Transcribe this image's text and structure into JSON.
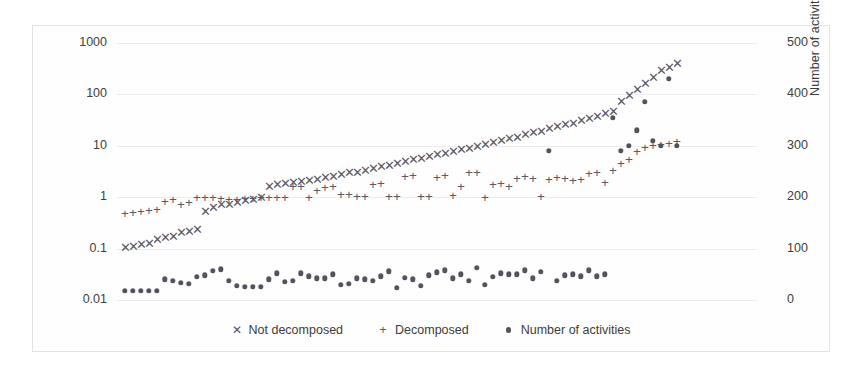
{
  "chart_data": {
    "type": "scatter",
    "title": "",
    "subtitle": "",
    "xlabel": "",
    "ylabel": "Computation time (in seconds)",
    "y2label": "Number of activities",
    "yscale": "log",
    "ylim": [
      0.01,
      1000
    ],
    "y2lim": [
      0,
      500
    ],
    "xlim": [
      0,
      80
    ],
    "grid": true,
    "legend_position": "bottom-center",
    "yticks": [
      "0.01",
      "0.1",
      "1",
      "10",
      "100",
      "1000"
    ],
    "ytick_values": [
      0.01,
      0.1,
      1,
      10,
      100,
      1000
    ],
    "y2ticks": [
      "0",
      "100",
      "200",
      "300",
      "400",
      "500"
    ],
    "y2tick_values": [
      0,
      100,
      200,
      300,
      400,
      500
    ],
    "xtick_labels": [],
    "series": [
      {
        "name": "Not decomposed",
        "marker": "cross",
        "glyph": "✕",
        "color": "#5a5a64",
        "axis": "left",
        "x": [
          1,
          2,
          3,
          4,
          5,
          6,
          7,
          8,
          9,
          10,
          11,
          12,
          13,
          14,
          15,
          16,
          17,
          18,
          19,
          20,
          21,
          22,
          23,
          24,
          25,
          26,
          27,
          28,
          29,
          30,
          31,
          32,
          33,
          34,
          35,
          36,
          37,
          38,
          39,
          40,
          41,
          42,
          43,
          44,
          45,
          46,
          47,
          48,
          49,
          50,
          51,
          52,
          53,
          54,
          55,
          56,
          57,
          58,
          59,
          60,
          61,
          62,
          63,
          64,
          65,
          66,
          67,
          68,
          69,
          70
        ],
        "y": [
          0.105,
          0.11,
          0.12,
          0.125,
          0.15,
          0.16,
          0.17,
          0.2,
          0.21,
          0.23,
          0.52,
          0.62,
          0.7,
          0.72,
          0.78,
          0.83,
          0.88,
          0.95,
          1.6,
          1.7,
          1.8,
          1.9,
          2.0,
          2.1,
          2.2,
          2.4,
          2.5,
          2.7,
          2.9,
          3.0,
          3.3,
          3.5,
          3.8,
          4.1,
          4.4,
          4.8,
          5.2,
          5.6,
          6.0,
          6.5,
          7.0,
          7.6,
          8.2,
          8.8,
          9.5,
          10.5,
          11.5,
          12.5,
          13.5,
          14.5,
          16.0,
          17.5,
          19.0,
          21.0,
          23.0,
          25.0,
          27.0,
          30.0,
          33.0,
          37.0,
          41.0,
          46.0,
          70.0,
          95.0,
          120.0,
          160.0,
          210.0,
          280.0,
          330.0,
          390.0
        ]
      },
      {
        "name": "Decomposed",
        "marker": "plus",
        "glyph": "+",
        "color": "#5a5a64",
        "axis": "left",
        "x": [
          1,
          2,
          3,
          4,
          5,
          6,
          7,
          8,
          9,
          10,
          11,
          12,
          13,
          14,
          15,
          16,
          17,
          18,
          19,
          20,
          21,
          22,
          23,
          24,
          25,
          26,
          27,
          28,
          29,
          30,
          31,
          32,
          33,
          34,
          35,
          36,
          37,
          38,
          39,
          40,
          41,
          42,
          43,
          44,
          45,
          46,
          47,
          48,
          49,
          50,
          51,
          52,
          53,
          54,
          55,
          56,
          57,
          58,
          59,
          60,
          61,
          62,
          63,
          64,
          65,
          66,
          67,
          68,
          69,
          70
        ],
        "y": [
          0.48,
          0.5,
          0.52,
          0.54,
          0.56,
          0.82,
          0.88,
          0.72,
          0.76,
          0.95,
          0.98,
          0.95,
          0.92,
          0.9,
          0.9,
          0.92,
          0.94,
          0.95,
          0.95,
          0.96,
          0.97,
          1.55,
          1.6,
          0.98,
          1.3,
          1.5,
          1.55,
          1.1,
          1.1,
          1.0,
          1.0,
          1.7,
          1.8,
          1.0,
          1.0,
          2.5,
          2.6,
          1.0,
          1.0,
          2.4,
          2.6,
          1.05,
          1.6,
          2.9,
          3.0,
          0.95,
          1.7,
          1.8,
          1.6,
          2.3,
          2.5,
          2.3,
          1.0,
          2.2,
          2.4,
          2.3,
          2.1,
          2.2,
          2.8,
          2.9,
          1.9,
          3.2,
          4.5,
          5.2,
          7.5,
          9.0,
          10.0,
          10.5,
          11.0,
          12.0
        ]
      },
      {
        "name": "Number of activities",
        "marker": "dot",
        "glyph": "•",
        "color": "#53535d",
        "axis": "right",
        "x": [
          1,
          2,
          3,
          4,
          5,
          6,
          7,
          8,
          9,
          10,
          11,
          12,
          13,
          14,
          15,
          16,
          17,
          18,
          19,
          20,
          21,
          22,
          23,
          24,
          25,
          26,
          27,
          28,
          29,
          30,
          31,
          32,
          33,
          34,
          35,
          36,
          37,
          38,
          39,
          40,
          41,
          42,
          43,
          44,
          45,
          46,
          47,
          48,
          49,
          50,
          51,
          52,
          53,
          54,
          55,
          56,
          57,
          58,
          59,
          60,
          61,
          62,
          63,
          64,
          65,
          66,
          67,
          68,
          69,
          70
        ],
        "y": [
          18,
          18,
          18,
          18,
          18,
          40,
          38,
          33,
          31,
          45,
          48,
          57,
          60,
          38,
          28,
          26,
          26,
          26,
          40,
          52,
          36,
          37,
          52,
          46,
          42,
          42,
          50,
          30,
          32,
          42,
          40,
          38,
          46,
          56,
          24,
          43,
          40,
          28,
          48,
          54,
          58,
          42,
          50,
          38,
          62,
          30,
          45,
          52,
          50,
          50,
          58,
          42,
          55,
          290,
          38,
          48,
          50,
          46,
          58,
          46,
          50,
          355,
          290,
          300,
          330,
          385,
          310,
          300,
          430,
          300
        ]
      }
    ]
  },
  "axes": {
    "left": {
      "title": "Computation time (in seconds)",
      "ticks": [
        "1000",
        "100",
        "10",
        "1",
        "0.1",
        "0.01"
      ]
    },
    "right": {
      "title": "Number of activities",
      "ticks": [
        "500",
        "400",
        "300",
        "200",
        "100",
        "0"
      ]
    }
  },
  "legend": {
    "items": [
      {
        "glyph": "✕",
        "label": "Not decomposed",
        "marker": "cross"
      },
      {
        "glyph": "+",
        "label": "Decomposed",
        "marker": "plus"
      },
      {
        "glyph": "•",
        "label": "Number of activities",
        "marker": "dot"
      }
    ]
  },
  "colors": {
    "marker": "#5a5a64",
    "dot": "#53535d",
    "grid": "#ededed",
    "frame": "#e2e2e2",
    "text": "#3c3c3c",
    "background": "#ffffff"
  }
}
